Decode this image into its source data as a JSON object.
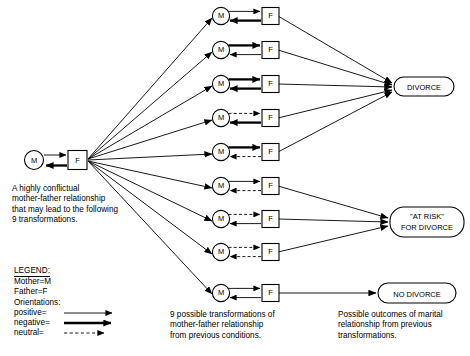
{
  "source_node": {
    "mother": "M",
    "father": "F"
  },
  "captions": {
    "left": "A highly conflictual\nmother-father relationship\nthat may lead to the following\n9 transformations.",
    "middle": "9 possible transformations of\nmother-father relationship\nfrom previous conditions.",
    "right": "Possible outcomes of marital\nrelationship from previous\ntransformations."
  },
  "legend": {
    "title": "LEGEND:",
    "mother": "Mother=M",
    "father": "Father=F",
    "orientations": "Orientations:",
    "positive": "positive=",
    "negative": "negative=",
    "neutral": "neutral="
  },
  "transformations": [
    {
      "mother": "M",
      "father": "F",
      "m_to_f": "positive",
      "f_to_m": "negative",
      "outcome": "divorce"
    },
    {
      "mother": "M",
      "father": "F",
      "m_to_f": "negative",
      "f_to_m": "positive",
      "outcome": "divorce"
    },
    {
      "mother": "M",
      "father": "F",
      "m_to_f": "negative",
      "f_to_m": "negative",
      "outcome": "divorce"
    },
    {
      "mother": "M",
      "father": "F",
      "m_to_f": "neutral",
      "f_to_m": "negative",
      "outcome": "divorce"
    },
    {
      "mother": "M",
      "father": "F",
      "m_to_f": "negative",
      "f_to_m": "neutral",
      "outcome": "divorce"
    },
    {
      "mother": "M",
      "father": "F",
      "m_to_f": "positive",
      "f_to_m": "neutral",
      "outcome": "at-risk"
    },
    {
      "mother": "M",
      "father": "F",
      "m_to_f": "neutral",
      "f_to_m": "positive",
      "outcome": "at-risk"
    },
    {
      "mother": "M",
      "father": "F",
      "m_to_f": "neutral",
      "f_to_m": "neutral",
      "outcome": "at-risk"
    },
    {
      "mother": "M",
      "father": "F",
      "m_to_f": "positive",
      "f_to_m": "positive",
      "outcome": "no-divorce"
    }
  ],
  "outcomes": [
    {
      "id": "divorce",
      "label": "DIVORCE",
      "lines": [
        "DIVORCE"
      ]
    },
    {
      "id": "at-risk",
      "label": "\"AT RISK\" FOR DIVORCE",
      "lines": [
        "\"AT RISK\"",
        "FOR DIVORCE"
      ]
    },
    {
      "id": "no-divorce",
      "label": "NO DIVORCE",
      "lines": [
        "NO DIVORCE"
      ]
    }
  ],
  "colors": {
    "ink": "#000000",
    "paper": "#ffffff"
  }
}
